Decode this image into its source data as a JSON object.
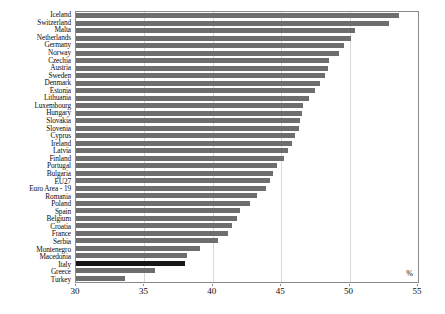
{
  "chart": {
    "type": "bar",
    "orientation": "horizontal",
    "unit_label": "%",
    "bar_color": "#6e6e6e",
    "highlight_color": "#171717",
    "highlight_category": "Italy"
  },
  "chart_data": {
    "type": "bar",
    "title": "",
    "xlabel": "%",
    "ylabel": "",
    "xlim": [
      30,
      55
    ],
    "xticks": [
      30,
      35,
      40,
      45,
      50,
      55
    ],
    "grid": true,
    "legend": "none",
    "categories": [
      "Iceland",
      "Switzerland",
      "Malta",
      "Netherlands",
      "Germany",
      "Norway",
      "Czechia",
      "Austria",
      "Sweden",
      "Denmark",
      "Estonia",
      "Lithuania",
      "Luxembourg",
      "Hungary",
      "Slovakia",
      "Slovenia",
      "Cyprus",
      "Ireland",
      "Latvia",
      "Finland",
      "Portugal",
      "Bulgaria",
      "EU27",
      "Euro Area - 19",
      "Romania",
      "Poland",
      "Spain",
      "Belgium",
      "Croatia",
      "France",
      "Serbia",
      "Montenegro",
      "Macedonia",
      "Italy",
      "Greece",
      "Turkey"
    ],
    "values": [
      53.6,
      52.9,
      50.4,
      50.1,
      49.6,
      49.2,
      48.5,
      48.4,
      48.2,
      47.8,
      47.5,
      47.0,
      46.6,
      46.5,
      46.4,
      46.3,
      46.0,
      45.8,
      45.5,
      45.2,
      44.7,
      44.4,
      44.2,
      43.9,
      43.2,
      42.7,
      42.0,
      41.8,
      41.4,
      41.1,
      40.4,
      39.1,
      38.1,
      38.0,
      35.8,
      33.6
    ]
  }
}
